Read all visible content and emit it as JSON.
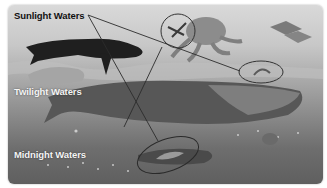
{
  "diagram": {
    "zones": [
      {
        "label": "Sunlight Waters"
      },
      {
        "label": "Twilight Waters"
      },
      {
        "label": "Midnight Waters"
      }
    ],
    "creatures": [
      "whale (orca-like, upper left)",
      "small crustacean (circled)",
      "octopus",
      "fish school (upper right)",
      "sperm whale (center)",
      "small creature (circled, right)",
      "anglerfish-like (circled, bottom)",
      "jellyfish glow dots"
    ],
    "callouts": [
      {
        "from": "Sunlight Waters",
        "to": "circled crustacean"
      },
      {
        "from": "Sunlight Waters",
        "to": "circled creature right"
      },
      {
        "from": "Sunlight Waters",
        "to": "circled creature bottom"
      }
    ],
    "colors": {
      "surface": "#d9d9d9",
      "deep": "#5f5f5f",
      "line": "#2b2b2b"
    }
  }
}
